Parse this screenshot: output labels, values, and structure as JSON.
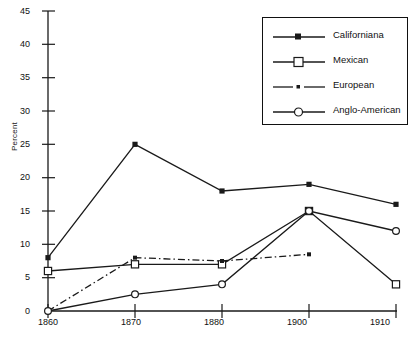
{
  "chart_data": {
    "type": "line",
    "title": "",
    "xlabel": "",
    "ylabel": "Percent",
    "x": [
      1860,
      1870,
      1880,
      1900,
      1910
    ],
    "xtick_labels": [
      "1860",
      "1870",
      "1880",
      "1900",
      "1910"
    ],
    "ytick_labels": [
      "0",
      "5",
      "10",
      "15",
      "20",
      "25",
      "30",
      "35",
      "40",
      "45"
    ],
    "yticks": [
      0,
      5,
      10,
      15,
      20,
      25,
      30,
      35,
      40,
      45
    ],
    "ylim": [
      0,
      45
    ],
    "grid": false,
    "legend_position": "top-right",
    "series": [
      {
        "name": "Californiana",
        "marker": "filled-square",
        "linestyle": "solid",
        "color": "#1a1a1a",
        "values": [
          8,
          25,
          18,
          19,
          16
        ]
      },
      {
        "name": "Mexican",
        "marker": "open-square",
        "linestyle": "solid",
        "color": "#1a1a1a",
        "values": [
          6,
          7,
          7,
          15,
          4
        ]
      },
      {
        "name": "European",
        "marker": "small-square",
        "linestyle": "dash-dot",
        "color": "#1a1a1a",
        "values": [
          0,
          8,
          7.5,
          8.5,
          null
        ]
      },
      {
        "name": "Anglo-American",
        "marker": "open-circle",
        "linestyle": "solid",
        "color": "#1a1a1a",
        "values": [
          0,
          2.5,
          4,
          15,
          12
        ]
      }
    ]
  },
  "legend": {
    "items": [
      {
        "label": "Californiana"
      },
      {
        "label": "Mexican"
      },
      {
        "label": "European"
      },
      {
        "label": "Anglo-American"
      }
    ]
  },
  "axis": {
    "y_title": "Percent"
  }
}
